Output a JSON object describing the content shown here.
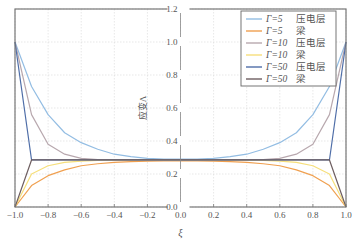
{
  "chart_data": {
    "type": "line",
    "title": "",
    "xlabel": "ξ",
    "ylabel": "应变Λ",
    "xlim": [
      -1.0,
      1.0
    ],
    "ylim": [
      0.0,
      1.2
    ],
    "grid": true,
    "legend_position": "upper right",
    "x_ticks": [
      "-1.0",
      "-0.8",
      "-0.6",
      "-0.4",
      "-0.2",
      "0.0",
      "0.2",
      "0.4",
      "0.6",
      "0.8",
      "1.0"
    ],
    "y_ticks": [
      "0.0",
      "0.2",
      "0.4",
      "0.6",
      "0.8",
      "1.0",
      "1.2"
    ],
    "x": [
      -1.0,
      -0.9,
      -0.8,
      -0.7,
      -0.6,
      -0.5,
      -0.4,
      -0.3,
      -0.2,
      -0.1,
      0.0,
      0.1,
      0.2,
      0.3,
      0.4,
      0.5,
      0.6,
      0.7,
      0.8,
      0.9,
      1.0
    ],
    "series": [
      {
        "name": "Γ=5 压电层",
        "color": "#93bde3",
        "values": [
          1.0,
          0.73,
          0.56,
          0.45,
          0.39,
          0.35,
          0.32,
          0.305,
          0.295,
          0.29,
          0.29,
          0.29,
          0.295,
          0.305,
          0.32,
          0.35,
          0.39,
          0.45,
          0.56,
          0.73,
          1.0
        ]
      },
      {
        "name": "Γ=5 梁",
        "color": "#f0a050",
        "values": [
          0.0,
          0.13,
          0.19,
          0.225,
          0.25,
          0.262,
          0.27,
          0.275,
          0.278,
          0.28,
          0.28,
          0.28,
          0.278,
          0.275,
          0.27,
          0.262,
          0.25,
          0.225,
          0.19,
          0.13,
          0.0
        ]
      },
      {
        "name": "Γ=10 压电层",
        "color": "#b8a8ae",
        "values": [
          1.0,
          0.56,
          0.38,
          0.32,
          0.295,
          0.288,
          0.286,
          0.285,
          0.285,
          0.285,
          0.285,
          0.285,
          0.285,
          0.285,
          0.286,
          0.288,
          0.295,
          0.32,
          0.38,
          0.56,
          1.0
        ]
      },
      {
        "name": "Γ=10 梁",
        "color": "#f6df7c",
        "values": [
          0.0,
          0.2,
          0.25,
          0.27,
          0.278,
          0.282,
          0.284,
          0.285,
          0.285,
          0.285,
          0.285,
          0.285,
          0.285,
          0.285,
          0.284,
          0.282,
          0.278,
          0.27,
          0.25,
          0.2,
          0.0
        ]
      },
      {
        "name": "Γ=50 压电层",
        "color": "#4f6ea8",
        "values": [
          1.0,
          0.285,
          0.285,
          0.285,
          0.285,
          0.285,
          0.285,
          0.285,
          0.285,
          0.285,
          0.285,
          0.285,
          0.285,
          0.285,
          0.285,
          0.285,
          0.285,
          0.285,
          0.285,
          0.285,
          1.0
        ]
      },
      {
        "name": "Γ=50 梁",
        "color": "#6e5e60",
        "values": [
          0.0,
          0.285,
          0.285,
          0.285,
          0.285,
          0.285,
          0.285,
          0.285,
          0.285,
          0.285,
          0.285,
          0.285,
          0.285,
          0.285,
          0.285,
          0.285,
          0.285,
          0.285,
          0.285,
          0.285,
          0.0
        ]
      }
    ]
  },
  "legend": {
    "items": [
      {
        "gamma": "Γ=5",
        "label": "压电层"
      },
      {
        "gamma": "Γ=5",
        "label": "梁"
      },
      {
        "gamma": "Γ=10",
        "label": "压电层"
      },
      {
        "gamma": "Γ=10",
        "label": "梁"
      },
      {
        "gamma": "Γ=50",
        "label": "压电层"
      },
      {
        "gamma": "Γ=50",
        "label": "梁"
      }
    ]
  }
}
